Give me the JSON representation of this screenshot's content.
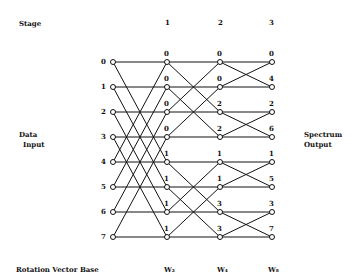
{
  "labels": {
    "stage": "Stage",
    "data_input_1": "Data",
    "data_input_2": "Input",
    "spectrum_output_1": "Spectrum",
    "spectrum_output_2": "Output",
    "rotation_vector_base": "Rotation Vector Base"
  },
  "stages": [
    "1",
    "2",
    "3"
  ],
  "rotation_bases": [
    "W₂",
    "W₄",
    "W₈"
  ],
  "inputs": [
    "0",
    "1",
    "2",
    "3",
    "4",
    "5",
    "6",
    "7"
  ],
  "stage1_weights": [
    "0",
    "0",
    "0",
    "0",
    "1",
    "1",
    "1",
    "1"
  ],
  "stage2_weights": [
    "0",
    "0",
    "2",
    "2",
    "1",
    "1",
    "3",
    "3"
  ],
  "outputs": [
    "0",
    "4",
    "2",
    "6",
    "1",
    "5",
    "3",
    "7"
  ]
}
